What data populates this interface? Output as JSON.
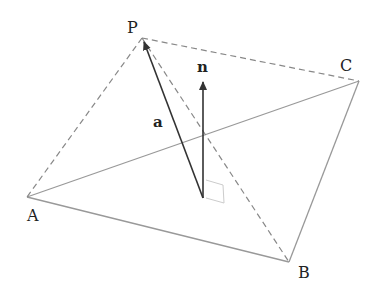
{
  "diagram": {
    "vertices": {
      "P": "P",
      "A": "A",
      "B": "B",
      "C": "C"
    },
    "vectors": {
      "a": "a",
      "n": "n"
    },
    "colors": {
      "vector": "#333333",
      "base_edge": "#999999",
      "dashed_edge": "#888888",
      "right_angle": "#cccccc"
    }
  }
}
